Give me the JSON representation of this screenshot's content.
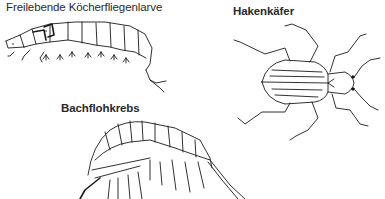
{
  "figure": {
    "specimens": [
      {
        "id": "larva",
        "label": "Freilebende Köcherfliegenlarve",
        "bold": false,
        "icon": "caddisfly-larva-illustration"
      },
      {
        "id": "beetle",
        "label": "Hakenkäfer",
        "bold": true,
        "icon": "riffle-beetle-illustration"
      },
      {
        "id": "amphipod",
        "label": "Bachflohkrebs",
        "bold": true,
        "icon": "freshwater-shrimp-illustration"
      }
    ],
    "colors": {
      "ink": "#1a1a1a",
      "text": "#2a2a2a",
      "background": "#ffffff"
    }
  }
}
